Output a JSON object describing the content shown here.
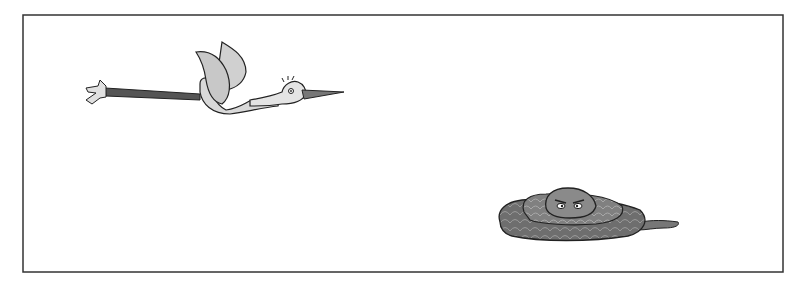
{
  "illustration": {
    "description": "Hand-drawn illustration in a rectangular frame: a stork flying left-to-right at upper left, and a coiled snake with angry eyes at lower right",
    "frame": {
      "x": 23,
      "y": 15,
      "width": 760,
      "height": 257,
      "stroke": "#333333"
    },
    "subjects": [
      {
        "name": "stork",
        "position": "upper-left",
        "action": "flying"
      },
      {
        "name": "snake",
        "position": "lower-right",
        "action": "coiled"
      }
    ],
    "colors": {
      "background": "#ffffff",
      "outline": "#222222",
      "stork_body": "#d9d9d9",
      "stork_legs": "#555555",
      "snake_body": "#6e6e6e",
      "snake_head": "#888888"
    }
  }
}
